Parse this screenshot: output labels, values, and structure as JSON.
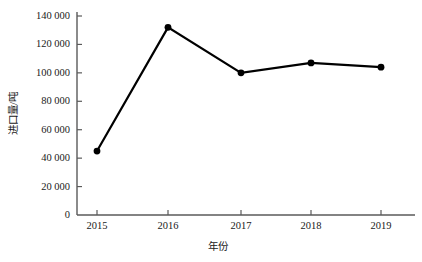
{
  "chart_data": {
    "type": "line",
    "title": "",
    "xlabel": "年份",
    "ylabel": "进口量/吨",
    "categories": [
      "2015",
      "2016",
      "2017",
      "2018",
      "2019"
    ],
    "values": [
      45000,
      132000,
      100000,
      107000,
      104000
    ],
    "series": [
      {
        "name": "进口量",
        "values": [
          45000,
          132000,
          100000,
          107000,
          104000
        ]
      }
    ],
    "ylim": [
      0,
      140000
    ],
    "ytick_values": [
      0,
      20000,
      40000,
      60000,
      80000,
      100000,
      120000,
      140000
    ],
    "ytick_labels": [
      "0",
      "20 000",
      "40 000",
      "60 000",
      "80 000",
      "100 000",
      "120 000",
      "140 000"
    ],
    "xtick_labels": [
      "2015",
      "2016",
      "2017",
      "2018",
      "2019"
    ],
    "grid": false,
    "legend": false,
    "legend_position": "none",
    "marker": "circle",
    "line_color": "#000000",
    "marker_color": "#000000",
    "axis_color": "#5a5a5a",
    "background_color": "#ffffff"
  }
}
